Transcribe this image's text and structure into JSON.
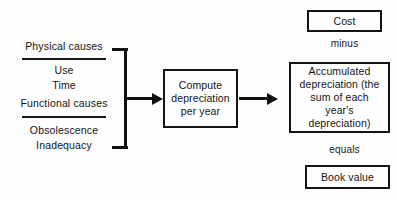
{
  "diagram": {
    "background_color": "#fdfdfd",
    "line_color": "#111111",
    "text_color": "#141414",
    "causes": {
      "group_1": [
        "Physical causes"
      ],
      "group_2": [
        "Use",
        "Time",
        "Functional causes"
      ],
      "group_3": [
        "Obsolescence",
        "Inadequacy"
      ],
      "items": [
        {
          "label": "Physical causes"
        },
        {
          "label": "Use"
        },
        {
          "label": "Time"
        },
        {
          "label": "Functional causes"
        },
        {
          "label": "Obsolescence"
        },
        {
          "label": "Inadequacy"
        }
      ]
    },
    "boxes": {
      "compute": "Compute depreciation per year",
      "accumulated": "Accumulated depreciation (the sum of each year's depreciation)",
      "cost": "Cost",
      "book_value": "Book value"
    },
    "connectors": {
      "minus": "minus",
      "equals": "equals"
    }
  }
}
